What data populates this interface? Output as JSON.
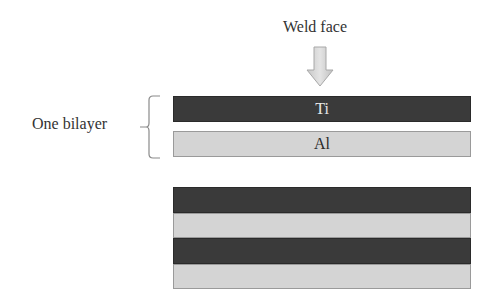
{
  "diagram": {
    "title": "Weld face",
    "arrow_icon": "down-arrow-icon",
    "bilayer_label": "One bilayer",
    "brace_icon": "curly-brace-icon",
    "bilayer": [
      {
        "label": "Ti",
        "material": "titanium",
        "color": "#3a3a3a"
      },
      {
        "label": "Al",
        "material": "aluminum",
        "color": "#d4d4d4"
      }
    ],
    "stack": [
      {
        "material": "titanium",
        "color": "#3a3a3a"
      },
      {
        "material": "aluminum",
        "color": "#d4d4d4"
      },
      {
        "material": "titanium",
        "color": "#3a3a3a"
      },
      {
        "material": "aluminum",
        "color": "#d4d4d4"
      }
    ]
  }
}
